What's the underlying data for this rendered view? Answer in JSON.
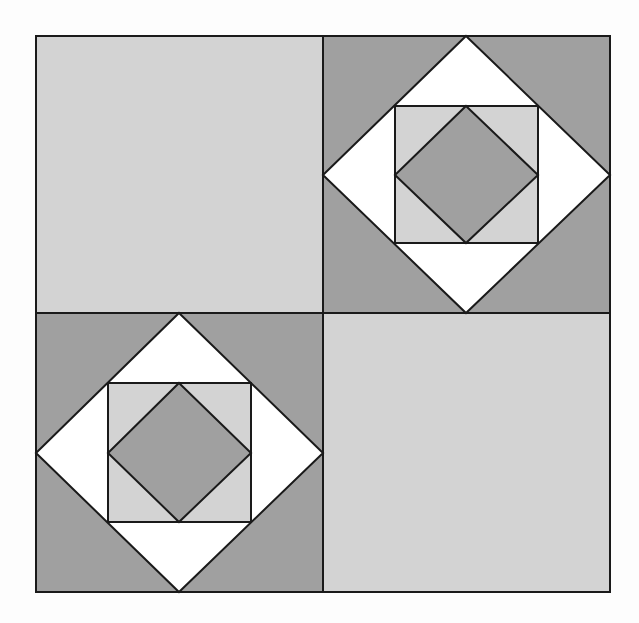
{
  "diagram": {
    "type": "quilt-block",
    "colors": {
      "background": "#fdfdfd",
      "light": "#d3d3d3",
      "dark": "#a0a0a0",
      "white": "#ffffff",
      "stroke": "#1a1a1a"
    },
    "outer": {
      "x": 36,
      "y": 36,
      "w": 574,
      "h": 556
    },
    "divider": {
      "x": 323,
      "y": 313
    },
    "patches": [
      {
        "name": "top-left",
        "kind": "plain",
        "fill": "light"
      },
      {
        "name": "top-right",
        "kind": "diamond-in-square"
      },
      {
        "name": "bottom-left",
        "kind": "diamond-in-square"
      },
      {
        "name": "bottom-right",
        "kind": "plain",
        "fill": "light"
      }
    ]
  }
}
